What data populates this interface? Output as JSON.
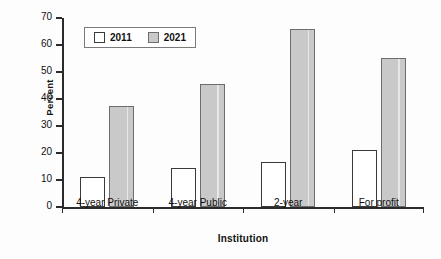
{
  "chart_data": {
    "type": "bar",
    "title": "",
    "xlabel": "Institution",
    "ylabel": "Percent",
    "categories": [
      "4-year Private",
      "4-year Public",
      "2-year",
      "For profit"
    ],
    "series": [
      {
        "name": "2011",
        "values": [
          11.1,
          14.4,
          16.7,
          21.1
        ]
      },
      {
        "name": "2021",
        "values": [
          37.4,
          45.6,
          66.0,
          55.2
        ]
      }
    ],
    "ylim": [
      0,
      70
    ],
    "ytick_labels": [
      "70",
      "60",
      "50",
      "40",
      "30",
      "20",
      "10",
      "0"
    ],
    "ytick_values": [
      70,
      60,
      50,
      40,
      30,
      20,
      10,
      0
    ],
    "grid": false,
    "legend_position": "upper-left-inside",
    "colors": {
      "series_2011_fill": "#ffffff",
      "series_2011_stroke": "#3a3a3a",
      "series_2021_fill": "#c9c9c9",
      "series_2021_stroke": "#6d6d6d",
      "axis": "#2b2b2b",
      "text": "#111111",
      "background": "#fdfdfd"
    }
  },
  "legend": {
    "entries": [
      {
        "label": "2011",
        "swatch": "hollow-square-swatch"
      },
      {
        "label": "2021",
        "swatch": "gray-square-swatch"
      }
    ]
  },
  "axes": {
    "y_title": "Percent",
    "x_title": "Institution"
  }
}
